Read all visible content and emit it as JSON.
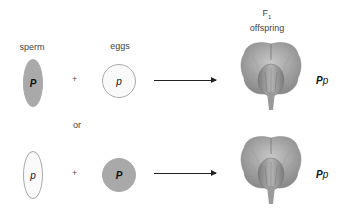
{
  "labels": {
    "sperm": "sperm",
    "eggs": "eggs",
    "offspring_line1": "F",
    "offspring_sub": "1",
    "offspring_line2": "offspring",
    "or": "or",
    "plus": "+"
  },
  "crosses": [
    {
      "sperm_allele": "P",
      "sperm_color": "#a9a9a9",
      "egg_allele": "p",
      "egg_color": "#fafafa",
      "offspring_genotype_dominant": "P",
      "offspring_genotype_recessive": "p"
    },
    {
      "sperm_allele": "p",
      "sperm_color": "#fafafa",
      "egg_allele": "P",
      "egg_color": "#a9a9a9",
      "offspring_genotype_dominant": "P",
      "offspring_genotype_recessive": "p"
    }
  ],
  "icons": {
    "flower": "purple-pea-flower-icon"
  }
}
